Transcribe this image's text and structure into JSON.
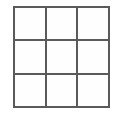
{
  "figure": {
    "name": "3x3 grid",
    "type": "grid-diagram",
    "rows": 3,
    "columns": 3,
    "cell_count": 9,
    "line_color": "#5a5a5a",
    "cell_fill_color": "#fefefe",
    "background_color": "#ffffff",
    "border_width_px": 2,
    "divider_width_px": 2,
    "cells": [
      {
        "id": "cell-r1c1",
        "row": 1,
        "column": 1,
        "label": ""
      },
      {
        "id": "cell-r1c2",
        "row": 1,
        "column": 2,
        "label": ""
      },
      {
        "id": "cell-r1c3",
        "row": 1,
        "column": 3,
        "label": ""
      },
      {
        "id": "cell-r2c1",
        "row": 2,
        "column": 1,
        "label": ""
      },
      {
        "id": "cell-r2c2",
        "row": 2,
        "column": 2,
        "label": ""
      },
      {
        "id": "cell-r2c3",
        "row": 2,
        "column": 3,
        "label": ""
      },
      {
        "id": "cell-r3c1",
        "row": 3,
        "column": 1,
        "label": ""
      },
      {
        "id": "cell-r3c2",
        "row": 3,
        "column": 2,
        "label": ""
      },
      {
        "id": "cell-r3c3",
        "row": 3,
        "column": 3,
        "label": ""
      }
    ]
  }
}
